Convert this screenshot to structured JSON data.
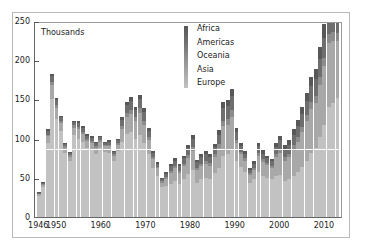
{
  "chart_data": {
    "type": "bar",
    "stacked": true,
    "title": "",
    "subtitle": "",
    "xlabel": "",
    "ylabel": "Thousands",
    "unit_note": "Thousands",
    "ylim": [
      0,
      250
    ],
    "yticks": [
      0,
      50,
      100,
      150,
      200,
      250
    ],
    "xticks": [
      1946,
      1950,
      1960,
      1970,
      1980,
      1990,
      2000,
      2010
    ],
    "grid": false,
    "legend_position": "top-center",
    "reference_line": {
      "value": 85,
      "color": "#ffffff"
    },
    "legend": [
      "Africa",
      "Americas",
      "Oceania",
      "Asia",
      "Europe"
    ],
    "series_colors": {
      "Africa": "#585858",
      "Americas": "#6e6e6e",
      "Oceania": "#8c8c8c",
      "Asia": "#a8a8a8",
      "Europe": "#c2c2c2"
    },
    "categories": [
      1946,
      1947,
      1948,
      1949,
      1950,
      1951,
      1952,
      1953,
      1954,
      1955,
      1956,
      1957,
      1958,
      1959,
      1960,
      1961,
      1962,
      1963,
      1964,
      1965,
      1966,
      1967,
      1968,
      1969,
      1970,
      1971,
      1972,
      1973,
      1974,
      1975,
      1976,
      1977,
      1978,
      1979,
      1980,
      1981,
      1982,
      1983,
      1984,
      1985,
      1986,
      1987,
      1988,
      1989,
      1990,
      1991,
      1992,
      1993,
      1994,
      1995,
      1996,
      1997,
      1998,
      1999,
      2000,
      2001,
      2002,
      2003,
      2004,
      2005,
      2006,
      2007,
      2008,
      2009,
      2010,
      2011,
      2012,
      2013,
      2014
    ],
    "series": [
      {
        "name": "Europe",
        "values": [
          27,
          38,
          95,
          150,
          125,
          110,
          82,
          72,
          105,
          100,
          96,
          88,
          85,
          80,
          88,
          83,
          82,
          72,
          84,
          96,
          106,
          108,
          100,
          105,
          94,
          80,
          62,
          52,
          38,
          40,
          42,
          46,
          42,
          48,
          55,
          60,
          44,
          48,
          50,
          48,
          56,
          62,
          78,
          80,
          86,
          72,
          64,
          58,
          44,
          48,
          58,
          52,
          50,
          48,
          52,
          54,
          46,
          48,
          52,
          58,
          64,
          72,
          82,
          88,
          102,
          118,
          140,
          146,
          152
        ]
      },
      {
        "name": "Asia",
        "values": [
          2,
          3,
          8,
          18,
          14,
          10,
          6,
          5,
          9,
          12,
          10,
          9,
          9,
          8,
          8,
          7,
          8,
          6,
          8,
          16,
          22,
          24,
          22,
          28,
          24,
          18,
          12,
          10,
          6,
          9,
          14,
          16,
          14,
          17,
          20,
          24,
          16,
          17,
          18,
          17,
          20,
          26,
          38,
          38,
          42,
          22,
          16,
          14,
          10,
          12,
          20,
          18,
          16,
          14,
          24,
          28,
          26,
          28,
          34,
          38,
          44,
          50,
          56,
          58,
          66,
          74,
          82,
          78,
          72
        ]
      },
      {
        "name": "Oceania",
        "values": [
          1,
          1,
          2,
          4,
          4,
          3,
          2,
          2,
          3,
          3,
          3,
          3,
          3,
          2,
          2,
          2,
          2,
          2,
          2,
          4,
          5,
          5,
          5,
          6,
          5,
          4,
          3,
          2,
          2,
          2,
          3,
          3,
          3,
          3,
          4,
          5,
          3,
          3,
          4,
          4,
          4,
          5,
          7,
          7,
          8,
          4,
          3,
          3,
          2,
          3,
          4,
          4,
          3,
          3,
          4,
          5,
          5,
          5,
          6,
          6,
          7,
          8,
          9,
          9,
          10,
          11,
          12,
          12,
          11
        ]
      },
      {
        "name": "Americas",
        "values": [
          1,
          2,
          5,
          8,
          6,
          4,
          3,
          3,
          4,
          5,
          5,
          4,
          4,
          4,
          4,
          3,
          4,
          3,
          4,
          8,
          10,
          11,
          10,
          12,
          11,
          8,
          5,
          4,
          3,
          4,
          6,
          7,
          6,
          7,
          9,
          11,
          7,
          8,
          8,
          8,
          9,
          12,
          16,
          16,
          18,
          10,
          7,
          6,
          4,
          5,
          8,
          7,
          6,
          6,
          9,
          11,
          10,
          11,
          13,
          14,
          16,
          18,
          20,
          21,
          24,
          26,
          28,
          26,
          24
        ]
      },
      {
        "name": "Africa",
        "values": [
          1,
          1,
          2,
          3,
          3,
          2,
          1,
          1,
          2,
          2,
          2,
          2,
          2,
          2,
          2,
          1,
          2,
          1,
          2,
          3,
          4,
          5,
          4,
          5,
          5,
          4,
          2,
          2,
          1,
          2,
          3,
          3,
          3,
          3,
          4,
          5,
          3,
          4,
          4,
          4,
          4,
          6,
          8,
          8,
          9,
          5,
          4,
          3,
          2,
          3,
          4,
          4,
          3,
          3,
          5,
          6,
          5,
          6,
          7,
          8,
          9,
          10,
          12,
          13,
          15,
          17,
          18,
          17,
          16
        ]
      }
    ]
  },
  "axis_note": "Thousands",
  "ytick_labels": [
    "0",
    "50",
    "100",
    "150",
    "200",
    "250"
  ],
  "xtick_labels": [
    "1946",
    "1950",
    "1960",
    "1970",
    "1980",
    "1990",
    "2000",
    "2010"
  ],
  "legend": {
    "items": [
      {
        "label": "Africa"
      },
      {
        "label": "Americas"
      },
      {
        "label": "Oceania"
      },
      {
        "label": "Asia"
      },
      {
        "label": "Europe"
      }
    ]
  }
}
